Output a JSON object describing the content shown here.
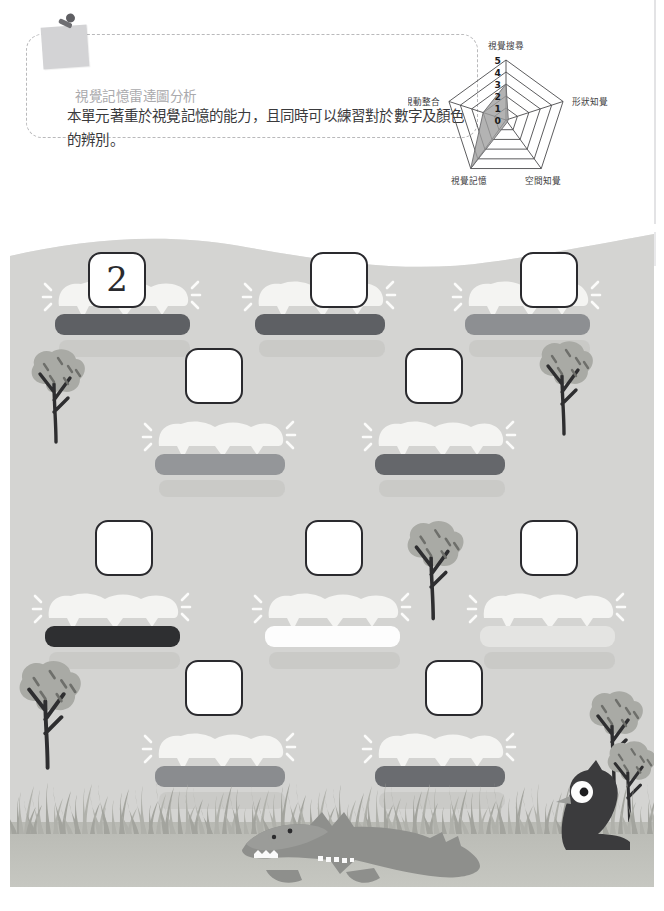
{
  "header": {
    "title": "視覺記憶雷達圖分析",
    "body": "本單元著重於視覺記憶的能力，且同時可以練習對於數字及顏色的辨別。",
    "pin_icon": "pushpin-icon"
  },
  "chart_data": {
    "type": "radar",
    "title": "視覺記憶雷達圖分析",
    "categories": [
      "視覺搜尋",
      "形狀知覺",
      "空間知覺",
      "視覺記憶",
      "視動整合"
    ],
    "values": [
      3,
      0.2,
      0.2,
      5,
      2
    ],
    "tick_labels": [
      "5",
      "4",
      "3",
      "2",
      "1",
      "0"
    ],
    "rmin": 0,
    "rmax": 5,
    "levels": 5,
    "grid": true,
    "legend": "none",
    "fill_color": "#9e9e9e",
    "grid_color": "#4a4a4c",
    "series": [
      {
        "name": "視覺記憶能力",
        "values": [
          3,
          0.2,
          0.2,
          5,
          2
        ]
      }
    ]
  },
  "worksheet": {
    "ground_color": "#d5d5d3",
    "rows": [
      {
        "row_label": "row-1",
        "items": [
          {
            "box_value": "2",
            "bar_color": "#5e6064",
            "bar_name": "dark-gray-log"
          },
          {
            "box_value": "",
            "bar_color": "#5e6064",
            "bar_name": "dark-gray-log"
          },
          {
            "box_value": "",
            "bar_color": "#8d8f92",
            "bar_name": "medium-gray-log"
          }
        ]
      },
      {
        "row_label": "row-2",
        "items": [
          {
            "box_value": "",
            "bar_color": "#949699",
            "bar_name": "medium-gray-log"
          },
          {
            "box_value": "",
            "bar_color": "#65676b",
            "bar_name": "dark-gray-log"
          }
        ]
      },
      {
        "row_label": "row-3",
        "items": [
          {
            "box_value": "",
            "bar_color": "#2e2f31",
            "bar_name": "black-log"
          },
          {
            "box_value": "",
            "bar_color": "#fdfdfd",
            "bar_name": "white-log"
          },
          {
            "box_value": "",
            "bar_color": "#e4e4e2",
            "bar_name": "light-gray-log"
          }
        ]
      },
      {
        "row_label": "row-4",
        "items": [
          {
            "box_value": "",
            "bar_color": "#8a8c8f",
            "bar_name": "medium-gray-log"
          },
          {
            "box_value": "",
            "bar_color": "#6a6c70",
            "bar_name": "dark-gray-log"
          }
        ]
      }
    ],
    "decor": {
      "trees": "tree-icon",
      "grass": "grass-band",
      "crocodile": "crocodile-icon",
      "bird": "bird-icon"
    }
  }
}
